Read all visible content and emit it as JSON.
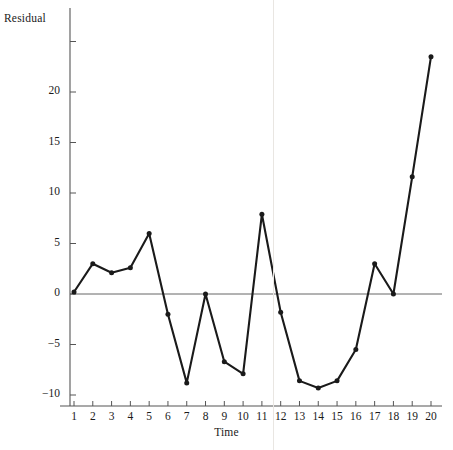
{
  "figure": {
    "background_color": "#ffffff",
    "line_color": "#1a1a1a",
    "marker_color": "#1a1a1a",
    "axis_color": "#555555",
    "zero_line_color": "#666666",
    "scanline_color": "#e9e6e2"
  },
  "axes": {
    "y_title": "Residual",
    "x_title": "Time",
    "y_ticks": [
      20,
      15,
      10,
      5,
      0,
      -5,
      -10
    ],
    "y_tick_labels": [
      "20",
      "15",
      "10",
      "5",
      "0",
      "−5",
      "−10"
    ],
    "x_ticks": [
      1,
      2,
      3,
      4,
      5,
      6,
      7,
      8,
      9,
      10,
      11,
      12,
      13,
      14,
      15,
      16,
      17,
      18,
      19,
      20
    ],
    "x_tick_labels": [
      "1",
      "2",
      "3",
      "4",
      "5",
      "6",
      "7",
      "8",
      "9",
      "10",
      "11",
      "12",
      "13",
      "14",
      "15",
      "16",
      "17",
      "18",
      "19",
      "20"
    ]
  },
  "chart_data": {
    "type": "line",
    "title": "",
    "subtitle": "",
    "xlabel": "Time",
    "ylabel": "Residual",
    "x": [
      1,
      2,
      3,
      4,
      5,
      6,
      7,
      8,
      9,
      10,
      11,
      12,
      13,
      14,
      15,
      16,
      17,
      18,
      19,
      20
    ],
    "values": [
      0.2,
      3.0,
      2.1,
      2.6,
      6.0,
      -2.0,
      -8.8,
      0.0,
      -6.7,
      -7.9,
      7.9,
      -1.8,
      -8.6,
      -9.3,
      -8.6,
      -5.5,
      3.0,
      0.0,
      11.6,
      23.5
    ],
    "series": [
      {
        "name": "Residual",
        "values": [
          0.2,
          3.0,
          2.1,
          2.6,
          6.0,
          -2.0,
          -8.8,
          0.0,
          -6.7,
          -7.9,
          7.9,
          -1.8,
          -8.6,
          -9.3,
          -8.6,
          -5.5,
          3.0,
          0.0,
          11.6,
          23.5
        ]
      }
    ],
    "xlim": [
      0.4,
      20.6
    ],
    "ylim": [
      -11.5,
      25.5
    ],
    "grid": false,
    "legend": false,
    "legend_position": "none",
    "markers": "dot",
    "reference_lines": [
      {
        "axis": "y",
        "value": 0
      }
    ],
    "annotations": []
  }
}
